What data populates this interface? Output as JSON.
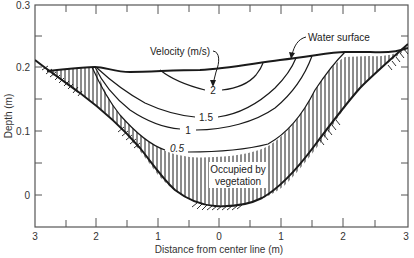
{
  "figure": {
    "y_axis": {
      "title": "Depth (m)",
      "ticks": [
        "0.3",
        "0.2",
        "0.1",
        "0"
      ],
      "range": [
        -0.05,
        0.3
      ]
    },
    "x_axis": {
      "title": "Distance from center line (m)",
      "ticks": [
        "3",
        "2",
        "1",
        "0",
        "1",
        "2",
        "3"
      ],
      "range": [
        -3,
        3
      ]
    },
    "annotations": {
      "velocity_label": "Velocity (m/s)",
      "water_surface_label": "Water surface",
      "vegetation_label_line1": "Occupied by",
      "vegetation_label_line2": "vegetation"
    },
    "contours": [
      {
        "label": "2",
        "value": 2
      },
      {
        "label": "1.5",
        "value": 1.5
      },
      {
        "label": "1",
        "value": 1
      },
      {
        "label": "0.5",
        "value": 0.5
      }
    ],
    "colors": {
      "line": "#1a1a1a",
      "frame": "#555555",
      "background": "#ffffff"
    }
  }
}
